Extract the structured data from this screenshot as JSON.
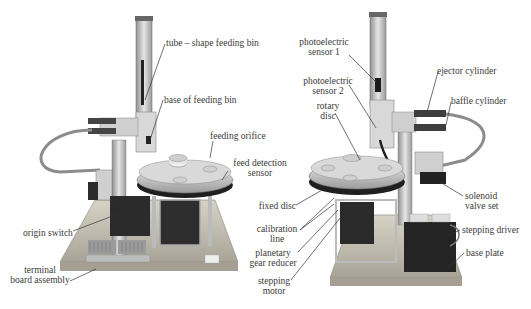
{
  "figure": {
    "left_photo": {
      "labels": [
        {
          "id": "tube",
          "text": "tube – shape feeding bin"
        },
        {
          "id": "base_bin",
          "text": "base of feeding bin"
        },
        {
          "id": "orifice",
          "text": "feeding orifice"
        },
        {
          "id": "feed_sensor_1",
          "text": "feed detection"
        },
        {
          "id": "feed_sensor_2",
          "text": "sensor"
        },
        {
          "id": "origin",
          "text": "origin switch"
        },
        {
          "id": "terminal_1",
          "text": "terminal"
        },
        {
          "id": "terminal_2",
          "text": "board assembly"
        }
      ]
    },
    "right_photo": {
      "labels": [
        {
          "id": "pe1_1",
          "text": "photoelectric"
        },
        {
          "id": "pe1_2",
          "text": "sensor 1"
        },
        {
          "id": "pe2_1",
          "text": "photoelectric"
        },
        {
          "id": "pe2_2",
          "text": "sensor 2"
        },
        {
          "id": "rotary_1",
          "text": "rotary"
        },
        {
          "id": "rotary_2",
          "text": "disc"
        },
        {
          "id": "fixed",
          "text": "fixed disc"
        },
        {
          "id": "calib_1",
          "text": "calibration"
        },
        {
          "id": "calib_2",
          "text": "line"
        },
        {
          "id": "planet_1",
          "text": "planetary"
        },
        {
          "id": "planet_2",
          "text": "gear reducer"
        },
        {
          "id": "step_1",
          "text": "stepping"
        },
        {
          "id": "step_2",
          "text": "motor"
        },
        {
          "id": "ejector",
          "text": "ejector cylinder"
        },
        {
          "id": "baffle",
          "text": "baffle cylinder"
        },
        {
          "id": "solenoid_1",
          "text": "solenoid"
        },
        {
          "id": "solenoid_2",
          "text": "valve set"
        },
        {
          "id": "driver",
          "text": "stepping driver"
        },
        {
          "id": "baseplate",
          "text": "base plate"
        }
      ]
    },
    "colors": {
      "label": "#3a3a3a",
      "leader": "#333333",
      "metal": "#b9b9b9",
      "dark": "#2a2a2a",
      "base": "#c9c4b8"
    }
  }
}
